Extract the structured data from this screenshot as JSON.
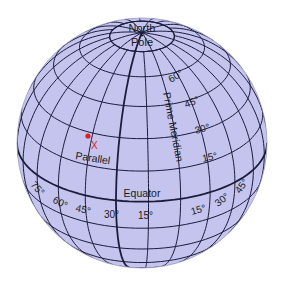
{
  "diagram": {
    "type": "globe-graticule",
    "colors": {
      "globe_fill": "#c4c4ee",
      "grid_line": "#1c1c3c",
      "marker": "#e02020",
      "background": "#ffffff"
    },
    "globe": {
      "cx": 142,
      "cy": 143,
      "r": 125,
      "tilt_deg": 28
    },
    "labels": {
      "north_pole_line1": "North",
      "north_pole_line2": "Pole",
      "prime_meridian": "Prime Meridian",
      "equator": "Equator",
      "parallel": "Parallel",
      "marker": "X"
    },
    "latitude_labels": [
      "60°",
      "45°",
      "30°",
      "15°"
    ],
    "longitude_labels_west": [
      "75°",
      "60°",
      "45°",
      "30°",
      "15°"
    ],
    "longitude_labels_east": [
      "15°",
      "30°",
      "45°"
    ]
  }
}
